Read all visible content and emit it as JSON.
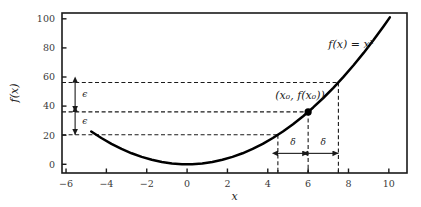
{
  "chart_data": {
    "type": "line",
    "title": "",
    "subtitle": "",
    "xlabel": "x",
    "ylabel": "f(x)",
    "xlim": [
      -6.2,
      10.9
    ],
    "ylim": [
      -6,
      104
    ],
    "grid": false,
    "legend": "none",
    "x_ticks": [
      "-6",
      "-4",
      "-2",
      "0",
      "2",
      "4",
      "6",
      "8",
      "10"
    ],
    "x_tick_values": [
      -6,
      -4,
      -2,
      0,
      2,
      4,
      6,
      8,
      10
    ],
    "x_minor_tick_values": [
      4.5,
      6,
      7.5
    ],
    "y_ticks": [
      "0",
      "20",
      "40",
      "60",
      "80",
      "100"
    ],
    "y_tick_values": [
      0,
      20,
      40,
      60,
      80,
      100
    ],
    "series": [
      {
        "name": "f(x) = x^2",
        "label": "f(x) = x²",
        "type": "line",
        "color": "#000000",
        "x_start": -4.75,
        "x_end": 10.05,
        "formula": "y = x^2",
        "x": [
          -4.75,
          -4.25,
          -3.75,
          -3.25,
          -2.75,
          -2.25,
          -1.75,
          -1.25,
          -0.75,
          -0.25,
          0.25,
          0.75,
          1.25,
          1.75,
          2.25,
          2.75,
          3.25,
          3.75,
          4.25,
          4.75,
          5.25,
          5.75,
          6.25,
          6.75,
          7.25,
          7.75,
          8.25,
          8.75,
          9.25,
          9.75,
          10.05
        ],
        "y": [
          22.56,
          18.06,
          14.06,
          10.56,
          7.56,
          5.06,
          3.06,
          1.56,
          0.56,
          0.06,
          0.06,
          0.56,
          1.56,
          3.06,
          5.06,
          7.56,
          10.56,
          14.06,
          18.06,
          22.56,
          27.56,
          33.06,
          39.06,
          45.56,
          52.56,
          60.06,
          68.06,
          76.56,
          85.56,
          95.06,
          101.0
        ]
      }
    ],
    "marked_point": {
      "label": "(x₀, f(x₀))",
      "x": 6,
      "y": 36,
      "marker": "filled-circle",
      "color": "#000000"
    },
    "epsilon": {
      "symbol": "ϵ",
      "upper_value": 20.25,
      "lower_value": 15.75,
      "upper_band_y": 56.25,
      "center_y": 36,
      "lower_band_y": 20.25,
      "arrow_x": -5.55
    },
    "delta": {
      "symbol": "δ",
      "value": 1.5,
      "x_left": 4.5,
      "x_center": 6,
      "x_right": 7.5,
      "arrow_y": 7.5
    },
    "guide_lines": {
      "horizontal_y": [
        56.25,
        36,
        20.25
      ],
      "vertical_x": [
        4.5,
        6,
        7.5
      ],
      "style": "dashed",
      "color": "#1a1a1a"
    },
    "annotations": [
      {
        "name": "function-label",
        "text": "f(x) = x²",
        "x": 7.0,
        "y": 80
      },
      {
        "name": "point-label",
        "text": "(x₀, f(x₀))",
        "x": 5.6,
        "y": 45
      },
      {
        "name": "epsilon-upper-label",
        "text": "ϵ",
        "x": -5.2,
        "y": 46
      },
      {
        "name": "epsilon-lower-label",
        "text": "ϵ",
        "x": -5.2,
        "y": 28
      },
      {
        "name": "delta-left-label",
        "text": "δ",
        "x": 5.25,
        "y": 13
      },
      {
        "name": "delta-right-label",
        "text": "δ",
        "x": 6.75,
        "y": 13
      }
    ],
    "colors": {
      "curve": "#000000",
      "frame": "#1a1a1a",
      "guide": "#1a1a1a",
      "tick_label": "#3a3a3a",
      "background": "#ffffff"
    }
  }
}
